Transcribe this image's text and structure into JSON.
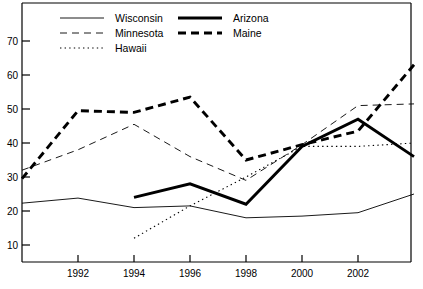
{
  "chart_data": {
    "type": "line",
    "title": "",
    "subtitle": "",
    "xlabel": "",
    "ylabel": "",
    "x": [
      1990,
      1992,
      1994,
      1996,
      1998,
      2000,
      2002,
      2004
    ],
    "xlim": [
      1990,
      2004
    ],
    "ylim": [
      5,
      76
    ],
    "xticks": [
      1992,
      1994,
      1996,
      1998,
      2000,
      2002
    ],
    "xtick_labels": [
      "1992",
      "1994",
      "1996",
      "1998",
      "2000",
      "2002"
    ],
    "yticks": [
      10,
      20,
      30,
      40,
      50,
      60,
      70
    ],
    "ytick_labels": [
      "10",
      "20",
      "30",
      "40",
      "50",
      "60",
      "70"
    ],
    "grid": false,
    "legend_position": "top-left-inside",
    "series": [
      {
        "name": "Wisconsin",
        "style": "solid-thin",
        "color": "#000000",
        "x": [
          1990,
          1992,
          1994,
          1996,
          1998,
          2000,
          2002,
          2004
        ],
        "values": [
          22.3,
          23.8,
          21.0,
          21.5,
          18.0,
          18.5,
          19.5,
          25.0
        ]
      },
      {
        "name": "Minnesota",
        "style": "dashed-thin",
        "color": "#000000",
        "x": [
          1990,
          1992,
          1994,
          1996,
          1998,
          2000,
          2002,
          2004
        ],
        "values": [
          32.0,
          38.0,
          45.5,
          36.0,
          29.0,
          39.5,
          51.0,
          51.5
        ]
      },
      {
        "name": "Hawaii",
        "style": "dotted-thin",
        "color": "#000000",
        "x": [
          1994,
          1996,
          1998,
          2000,
          2002,
          2004
        ],
        "values": [
          12.0,
          21.5,
          30.0,
          39.0,
          39.0,
          40.0
        ]
      },
      {
        "name": "Arizona",
        "style": "solid-thick",
        "color": "#000000",
        "x": [
          1994,
          1996,
          1998,
          2000,
          2002,
          2004
        ],
        "values": [
          24.0,
          28.0,
          22.0,
          39.0,
          47.0,
          36.0
        ]
      },
      {
        "name": "Maine",
        "style": "dashed-thick",
        "color": "#000000",
        "x": [
          1990,
          1992,
          1994,
          1996,
          1998,
          2000,
          2002,
          2004
        ],
        "values": [
          29.5,
          49.5,
          49.0,
          53.5,
          35.0,
          39.5,
          43.5,
          63.0
        ]
      }
    ],
    "legend": [
      {
        "label": "Wisconsin",
        "style": "solid-thin",
        "column": 1,
        "row": 1
      },
      {
        "label": "Minnesota",
        "style": "dashed-thin",
        "column": 1,
        "row": 2
      },
      {
        "label": "Hawaii",
        "style": "dotted-thin",
        "column": 1,
        "row": 3
      },
      {
        "label": "Arizona",
        "style": "solid-thick",
        "column": 2,
        "row": 1
      },
      {
        "label": "Maine",
        "style": "dashed-thick",
        "column": 2,
        "row": 2
      }
    ]
  },
  "colors": {
    "axis": "#000000",
    "plot_background": "#ffffff",
    "series": "#000000"
  }
}
